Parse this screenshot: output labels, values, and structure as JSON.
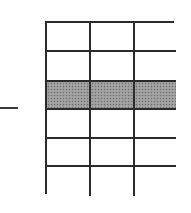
{
  "diagram": {
    "type": "grid-table",
    "rows": 6,
    "columns": 3,
    "highlighted_row_index": 2,
    "highlight_color": "#9a9a9a",
    "line_color": "#2a2a2a",
    "background_color": "#ffffff",
    "marker": {
      "type": "dash",
      "side": "left",
      "points_to_row_boundary": "below-highlighted-row"
    },
    "cells": [
      [
        "",
        "",
        ""
      ],
      [
        "",
        "",
        ""
      ],
      [
        "",
        "",
        ""
      ],
      [
        "",
        "",
        ""
      ],
      [
        "",
        "",
        ""
      ],
      [
        "",
        "",
        ""
      ]
    ]
  }
}
